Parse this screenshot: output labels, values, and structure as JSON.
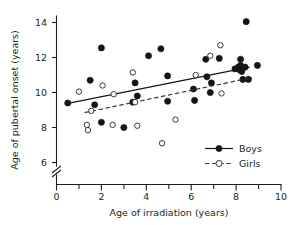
{
  "chart_data": {
    "type": "scatter",
    "title": "",
    "xlabel": "Age of irradiation (years)",
    "ylabel": "Age of pubertal onset (years)",
    "xlim": [
      0,
      10
    ],
    "ylim": [
      5.2,
      14.6
    ],
    "y_axis_break": true,
    "y_break_below": 6,
    "grid": false,
    "xticks": [
      0,
      2,
      4,
      6,
      8,
      10
    ],
    "xticks_minor": [
      1,
      3,
      5,
      7,
      9
    ],
    "xtick_labels": [
      "0",
      "2",
      "4",
      "6",
      "8",
      "10"
    ],
    "yticks": [
      6,
      8,
      10,
      12,
      14
    ],
    "ytick_labels": [
      "6",
      "8",
      "10",
      "12",
      "14"
    ],
    "legend_position": "lower-right",
    "series": [
      {
        "name": "Boys",
        "marker": "filled-circle",
        "line": "solid",
        "color": "#151515",
        "points": [
          [
            0.5,
            9.4
          ],
          [
            1.5,
            10.7
          ],
          [
            1.7,
            9.3
          ],
          [
            2.0,
            12.55
          ],
          [
            2.0,
            8.3
          ],
          [
            3.0,
            8.0
          ],
          [
            3.4,
            9.45
          ],
          [
            3.5,
            10.55
          ],
          [
            3.6,
            9.8
          ],
          [
            4.1,
            12.1
          ],
          [
            4.65,
            12.5
          ],
          [
            4.95,
            9.5
          ],
          [
            4.95,
            10.95
          ],
          [
            6.1,
            10.2
          ],
          [
            6.15,
            9.55
          ],
          [
            6.65,
            11.9
          ],
          [
            6.7,
            10.9
          ],
          [
            6.85,
            10.0
          ],
          [
            6.9,
            10.55
          ],
          [
            7.25,
            11.95
          ],
          [
            7.95,
            11.35
          ],
          [
            8.1,
            11.45
          ],
          [
            8.15,
            11.3
          ],
          [
            8.2,
            11.55
          ],
          [
            8.2,
            11.9
          ],
          [
            8.25,
            11.2
          ],
          [
            8.3,
            10.75
          ],
          [
            8.4,
            11.45
          ],
          [
            8.45,
            14.05
          ],
          [
            8.55,
            10.75
          ],
          [
            8.95,
            11.55
          ]
        ],
        "fit_line": {
          "x1": 0.4,
          "y1": 9.35,
          "x2": 8.6,
          "y2": 11.45
        }
      },
      {
        "name": "Girls",
        "marker": "open-circle",
        "line": "dashed",
        "color": "#3a3a3a",
        "points": [
          [
            1.0,
            10.05
          ],
          [
            1.35,
            8.15
          ],
          [
            1.4,
            7.85
          ],
          [
            1.55,
            8.95
          ],
          [
            2.05,
            10.4
          ],
          [
            2.5,
            8.15
          ],
          [
            2.55,
            9.9
          ],
          [
            3.4,
            11.15
          ],
          [
            3.5,
            9.45
          ],
          [
            3.6,
            8.1
          ],
          [
            4.7,
            7.1
          ],
          [
            5.3,
            8.45
          ],
          [
            6.2,
            11.0
          ],
          [
            6.85,
            12.1
          ],
          [
            7.3,
            12.7
          ],
          [
            7.35,
            9.95
          ]
        ],
        "fit_line": {
          "x1": 1.25,
          "y1": 8.85,
          "x2": 8.7,
          "y2": 10.85
        }
      }
    ]
  },
  "legend": {
    "items": [
      {
        "label": "Boys"
      },
      {
        "label": "Girls"
      }
    ]
  },
  "axes": {
    "x_title": "Age of irradiation (years)",
    "y_title": "Age of pubertal onset (years)"
  }
}
